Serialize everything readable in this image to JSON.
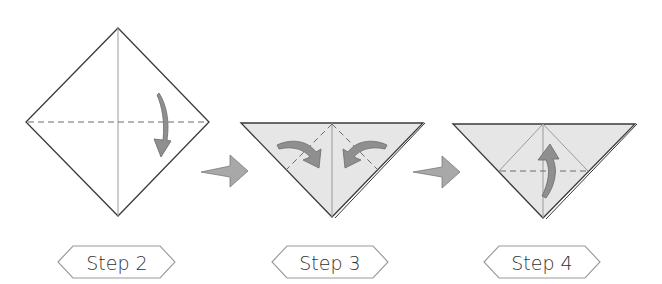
{
  "steps": [
    {
      "label": "Step 2",
      "shape": "square-diamond",
      "creases": [
        "vertical-center"
      ],
      "valley_folds": [
        "horizontal-center"
      ],
      "fold_arrows": 1,
      "arrow_direction": "down"
    },
    {
      "label": "Step 3",
      "shape": "triangle",
      "creases": [
        "vertical-center"
      ],
      "valley_folds": [
        "left-diagonal",
        "right-diagonal"
      ],
      "fold_arrows": 2,
      "arrow_direction": "inward"
    },
    {
      "label": "Step 4",
      "shape": "triangle",
      "creases": [
        "vertical-center",
        "inner-diamond"
      ],
      "valley_folds": [
        "horizontal-mid"
      ],
      "fold_arrows": 1,
      "arrow_direction": "up"
    }
  ],
  "transitions": [
    {
      "from": "Step 2",
      "to": "Step 3",
      "icon": "right-arrow-icon"
    },
    {
      "from": "Step 3",
      "to": "Step 4",
      "icon": "right-arrow-icon"
    }
  ],
  "colors": {
    "paper_front": "#ffffff",
    "paper_back": "#e6e6e6",
    "arrow_fill": "#8f8f8f",
    "outline": "#3a3a3a"
  }
}
